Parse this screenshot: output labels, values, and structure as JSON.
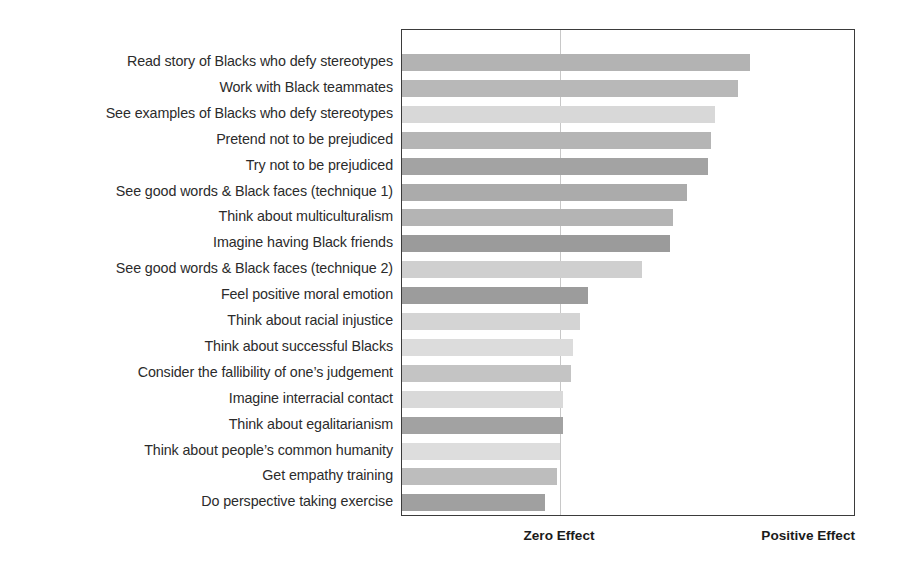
{
  "chart_data": {
    "type": "bar",
    "orientation": "horizontal",
    "title": "",
    "subtitle": "",
    "xlabel": "",
    "ylabel": "",
    "grid": false,
    "legend": "none",
    "axis_captions": {
      "zero": "Zero Effect",
      "positive": "Positive Effect"
    },
    "xlim": [
      -3.45,
      2.25
    ],
    "zero_reference": 0,
    "note": "Bars are drawn from the left edge of the plot area; the vertical reference line marks zero effect. Values are effect sizes estimated from bar end positions relative to the zero line, in plot-axis units.",
    "categories": [
      "Read story of Blacks who defy stereotypes",
      "Work with Black teammates",
      "See examples of Blacks who defy stereotypes",
      "Pretend not to be prejudiced",
      "Try not to be prejudiced",
      "See good words & Black faces (technique 1)",
      "Think about multiculturalism",
      "Imagine having Black friends",
      "See good words & Black faces (technique 2)",
      "Feel positive moral emotion",
      "Think about racial injustice",
      "Think about successful Blacks",
      "Consider the fallibility of one’s judgement",
      "Imagine interracial contact",
      "Think about egalitarianism",
      "Think about people’s common humanity",
      "Get empathy training",
      "Do perspective taking exercise"
    ],
    "values": [
      2.38,
      2.23,
      1.94,
      1.89,
      1.85,
      1.59,
      1.41,
      1.38,
      1.03,
      0.35,
      0.25,
      0.16,
      0.14,
      0.04,
      0.04,
      0.0,
      -0.04,
      -0.19
    ],
    "bar_end_px": [
      749,
      737,
      714,
      710,
      707,
      686,
      672,
      669,
      641,
      587,
      579,
      572,
      570,
      562,
      562,
      559,
      556,
      544
    ],
    "colors": [
      "#b3b3b3",
      "#b8b8b8",
      "#d8d8d8",
      "#b5b5b5",
      "#a3a3a3",
      "#ababab",
      "#b4b4b4",
      "#9b9b9b",
      "#cfcfcf",
      "#9c9c9c",
      "#d4d4d4",
      "#dcdcdc",
      "#c4c4c4",
      "#d9d9d9",
      "#a2a2a2",
      "#dddddd",
      "#bdbdbd",
      "#a0a0a0"
    ],
    "frame_color": "#3b3b3b",
    "zero_line_color": "#c8c8c8",
    "background": "#ffffff"
  },
  "layout": {
    "plot": {
      "left": 401,
      "top": 29,
      "width": 454,
      "height": 487
    },
    "zero_line_x_px": 559,
    "bar_first_top_px": 53,
    "bar_pitch_px": 25.9,
    "bar_height_px": 17
  }
}
